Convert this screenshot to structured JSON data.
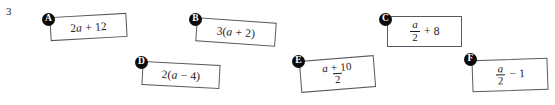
{
  "question": {
    "number": "3"
  },
  "cards": [
    {
      "id": "A",
      "label": "A",
      "expression": "2a + 12",
      "parts": [
        {
          "t": "2",
          "italic": false
        },
        {
          "t": "a",
          "italic": true
        },
        {
          "t": " + 12",
          "italic": false
        }
      ],
      "kind": "plain",
      "left": 50,
      "top": 15,
      "width": 77,
      "height": 24,
      "rotate": -3.2,
      "badge_left": 42,
      "badge_top": 13
    },
    {
      "id": "B",
      "label": "B",
      "expression": "3(a + 2)",
      "parts": [
        {
          "t": "3(",
          "italic": false
        },
        {
          "t": "a",
          "italic": true
        },
        {
          "t": " + 2)",
          "italic": false
        }
      ],
      "kind": "plain",
      "left": 196,
      "top": 20,
      "width": 80,
      "height": 24,
      "rotate": 4.0,
      "badge_left": 189,
      "badge_top": 13
    },
    {
      "id": "C",
      "label": "C",
      "expression": "a/2 + 8",
      "parts": [
        {
          "t": "a",
          "italic": true
        },
        {
          "t": "2",
          "italic": false
        },
        {
          "t": " + 8",
          "italic": false
        }
      ],
      "kind": "fraction-plus",
      "numerator": "a",
      "denominator": "2",
      "suffix": "+ 8",
      "left": 387,
      "top": 16,
      "width": 75,
      "height": 31,
      "rotate": 0.0,
      "badge_left": 379,
      "badge_top": 13
    },
    {
      "id": "D",
      "label": "D",
      "expression": "2(a − 4)",
      "parts": [
        {
          "t": "2(",
          "italic": false
        },
        {
          "t": "a",
          "italic": true
        },
        {
          "t": " − 4)",
          "italic": false
        }
      ],
      "kind": "plain",
      "left": 142,
      "top": 63,
      "width": 78,
      "height": 24,
      "rotate": 3.0,
      "badge_left": 135,
      "badge_top": 56
    },
    {
      "id": "E",
      "label": "E",
      "expression": "(a + 10)/2",
      "parts": [
        {
          "t": "a",
          "italic": true
        },
        {
          "t": " + 10",
          "italic": false
        },
        {
          "t": "2",
          "italic": false
        }
      ],
      "kind": "fraction-only",
      "numerator": "a + 10",
      "denominator": "2",
      "suffix": "",
      "left": 300,
      "top": 58,
      "width": 75,
      "height": 32,
      "rotate": -4.5,
      "badge_left": 292,
      "badge_top": 55
    },
    {
      "id": "F",
      "label": "F",
      "expression": "a/2 − 1",
      "parts": [
        {
          "t": "a",
          "italic": true
        },
        {
          "t": "2",
          "italic": false
        },
        {
          "t": " − 1",
          "italic": false
        }
      ],
      "kind": "fraction-minus",
      "numerator": "a",
      "denominator": "2",
      "suffix": "− 1",
      "left": 472,
      "top": 59,
      "width": 76,
      "height": 32,
      "rotate": -2.0,
      "badge_left": 464,
      "badge_top": 53
    }
  ],
  "symbols": {
    "plus": "+",
    "minus": "−"
  }
}
